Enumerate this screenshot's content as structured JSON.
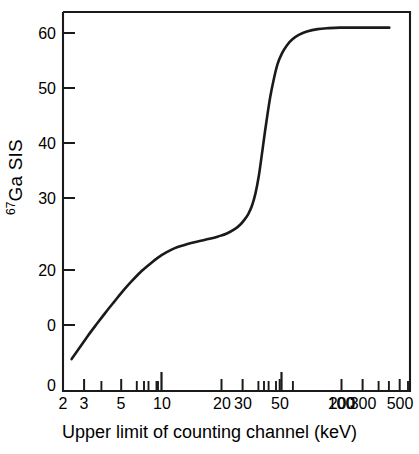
{
  "chart_data": {
    "type": "line",
    "title": "",
    "subtitle": "",
    "xlabel": "Upper limit of counting channel (keV)",
    "ylabel": "67Ga SIS",
    "ylabel_superscript": "67",
    "ylabel_base": "Ga SIS",
    "xscale": "log",
    "yscale": "linear",
    "xlim": [
      2,
      560
    ],
    "ylim": [
      -12,
      66
    ],
    "grid": false,
    "legend": null,
    "annotations": [],
    "line_color": "#1a1a1a",
    "axis_color": "#1a1a1a",
    "background_color": "#ffffff",
    "xticks_major": [
      10,
      100
    ],
    "xticks_labeled": [
      {
        "value": 2,
        "label": "2"
      },
      {
        "value": 3,
        "label": "3"
      },
      {
        "value": 5,
        "label": "5"
      },
      {
        "value": 10,
        "label": "10"
      },
      {
        "value": 20,
        "label": "20"
      },
      {
        "value": 30,
        "label": "30"
      },
      {
        "value": 50,
        "label": "50"
      },
      {
        "value": 100,
        "label": "100"
      },
      {
        "value": 200,
        "label": "200"
      },
      {
        "value": 300,
        "label": "300"
      },
      {
        "value": 500,
        "label": "500"
      }
    ],
    "xticks_minor": [
      4,
      6,
      7,
      8,
      9,
      40,
      60,
      70,
      80,
      90,
      400
    ],
    "yticks_labeled": [
      {
        "value": 60,
        "label": "60"
      },
      {
        "value": 50,
        "label": "50"
      },
      {
        "value": 40,
        "label": "40"
      },
      {
        "value": 30,
        "label": "30"
      },
      {
        "value": 20,
        "label": "20"
      },
      {
        "value": 0,
        "label": "0"
      }
    ],
    "y_axis_origin_label": "0",
    "x": [
      2.3,
      2.6,
      3.0,
      3.5,
      4.0,
      4.6,
      5.3,
      6.1,
      7.0,
      8.1,
      9.3,
      10.7,
      12.3,
      14.2,
      16.3,
      18.8,
      21.6,
      24.9,
      28.6,
      32.9,
      35.5,
      38.0,
      40.5,
      43.0,
      45.5,
      48.0,
      50.5,
      53.0,
      55.5,
      58.0,
      61.0,
      65.0,
      70.0,
      76.0,
      83.0,
      92.0,
      105.0,
      125.0,
      150.0,
      180.0,
      220.0,
      280.0,
      350.0,
      400.0
    ],
    "y": [
      -7.0,
      -4.8,
      -2.2,
      0.4,
      2.6,
      4.8,
      7.0,
      9.0,
      10.8,
      12.4,
      13.8,
      14.9,
      15.8,
      16.4,
      16.9,
      17.3,
      17.7,
      18.2,
      18.8,
      19.8,
      20.6,
      21.6,
      22.8,
      24.5,
      27.0,
      30.5,
      35.0,
      39.5,
      43.5,
      47.0,
      50.2,
      53.5,
      55.8,
      57.5,
      58.7,
      59.6,
      60.3,
      60.8,
      61.0,
      61.1,
      61.1,
      61.1,
      61.1,
      61.1
    ],
    "curve_description": "Double-sigmoid rising curve: steep initial rise from -7 to ~18 between 2 and 20 keV, a flat shoulder near 18 from 15-32 keV, a sharp sigmoidal jump from 20 to 58 between 35 and 80 keV, and a plateau at 61 above 150 keV.",
    "plateau_value": 61.1,
    "shoulder_value": 18.0,
    "start_value": -7.0
  }
}
